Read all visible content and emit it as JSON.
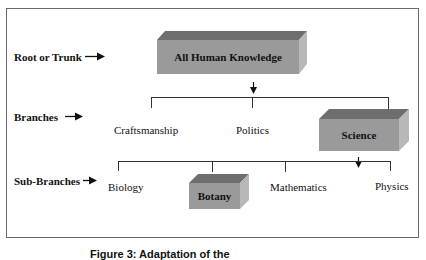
{
  "diagram": {
    "levels": [
      {
        "label": "Root or Trunk",
        "arrow": "→"
      },
      {
        "label": "Branches",
        "arrow": "→"
      },
      {
        "label": "Sub-Branches",
        "arrow": "→"
      }
    ],
    "root": {
      "label": "All Human Knowledge",
      "highlighted": true
    },
    "branches": [
      {
        "label": "Craftsmanship",
        "highlighted": false
      },
      {
        "label": "Politics",
        "highlighted": false
      },
      {
        "label": "Science",
        "highlighted": true
      }
    ],
    "sub_branches": [
      {
        "label": "Biology",
        "highlighted": false
      },
      {
        "label": "Botany",
        "highlighted": true
      },
      {
        "label": "Mathematics",
        "highlighted": false
      },
      {
        "label": "Physics",
        "highlighted": false
      }
    ],
    "caption": "Figure 3: Adaptation of the"
  },
  "colors": {
    "box_front": "#9a9a9a",
    "box_top": "#6e6e6e",
    "box_side": "#b8b8b8",
    "frame": "#6a6a6a",
    "lines": "#333333"
  }
}
